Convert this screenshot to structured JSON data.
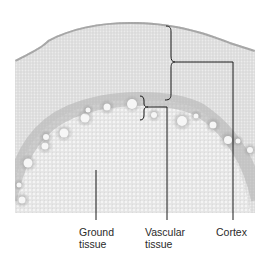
{
  "figure": {
    "colors": {
      "background": "#ffffff",
      "cortex_tissue": "#d8d8d8",
      "cortex_edge": "#9a9a9a",
      "ground_tissue": "#e2e2e2",
      "vascular_ring": "#a8a8a8",
      "vessel_lumen": "#f6f6f6",
      "leader_line": "#1a1a1a",
      "label_text": "#2a2a2a"
    }
  },
  "labels": {
    "ground_tissue": {
      "line1": "Ground",
      "line2": "tissue"
    },
    "vascular_tissue": {
      "line1": "Vascular",
      "line2": "tissue"
    },
    "cortex": {
      "line1": "Cortex"
    }
  }
}
